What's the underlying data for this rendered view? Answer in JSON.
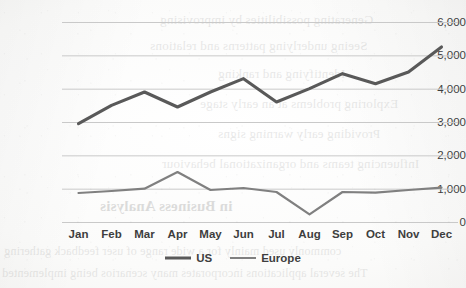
{
  "chart_data": {
    "type": "line",
    "title": "",
    "xlabel": "",
    "ylabel": "",
    "categories": [
      "Jan",
      "Feb",
      "Mar",
      "Apr",
      "May",
      "Jun",
      "Jul",
      "Aug",
      "Sep",
      "Oct",
      "Nov",
      "Dec"
    ],
    "series": [
      {
        "name": "US",
        "color": "#595959",
        "values": [
          2950,
          3500,
          3900,
          3450,
          3900,
          4300,
          3600,
          4000,
          4450,
          4150,
          4500,
          5250
        ]
      },
      {
        "name": "Europe",
        "color": "#808080",
        "values": [
          870,
          930,
          1000,
          1500,
          960,
          1020,
          900,
          230,
          900,
          880,
          960,
          1030
        ]
      }
    ],
    "ylim": [
      0,
      6000
    ],
    "ytick_values": [
      0,
      1000,
      2000,
      3000,
      4000,
      5000,
      6000
    ],
    "ytick_labels": [
      "0",
      "1,000",
      "2,000",
      "3,000",
      "4,000",
      "5,000",
      "6,000"
    ],
    "grid": true,
    "grid_axis": "y",
    "legend_position": "bottom",
    "markers": false
  },
  "legend": {
    "entries": [
      {
        "label": "US",
        "color": "#595959",
        "thickness": 3.1
      },
      {
        "label": "Europe",
        "color": "#808080",
        "thickness": 2.2
      }
    ]
  },
  "background_text": {
    "note": "faint bleed-through from reverse side of scanned page",
    "lines": [
      "Generating possibilities by improvising",
      "Seeing underlying patterns and relations",
      "Identifying and ranking",
      "Exploring problems at an early stage",
      "Providing early warning signs",
      "Influencing teams and organizational behaviour",
      "in Business Analysis",
      "commonly used mainly for a wide range of user feedback gathering",
      "The several applications incorporates many scenarios being implemented"
    ]
  }
}
